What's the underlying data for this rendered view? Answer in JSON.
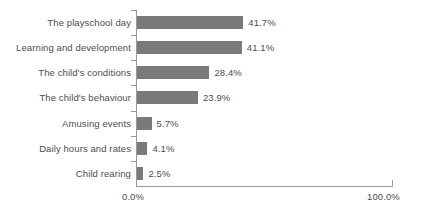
{
  "chart_data": {
    "type": "bar",
    "orientation": "horizontal",
    "title": "",
    "subtitle": "",
    "xlabel": "",
    "ylabel": "",
    "xlim": [
      0,
      100
    ],
    "grid": false,
    "legend": null,
    "bar_color": "#7a7a7a",
    "axis_color": "#9a9a9a",
    "text_color": "#4d4d4d",
    "xtick_labels": [
      "0.0%",
      "100.0%"
    ],
    "xticks": [
      0,
      100
    ],
    "categories": [
      "The playschool day",
      "Learning and development",
      "The child's conditions",
      "The child's behaviour",
      "Amusing events",
      "Daily hours and rates",
      "Child rearing"
    ],
    "values": [
      41.7,
      41.1,
      28.4,
      23.9,
      5.7,
      4.1,
      2.5
    ],
    "value_labels": [
      "41.7%",
      "41.1%",
      "28.4%",
      "23.9%",
      "5.7%",
      "4.1%",
      "2.5%"
    ]
  }
}
